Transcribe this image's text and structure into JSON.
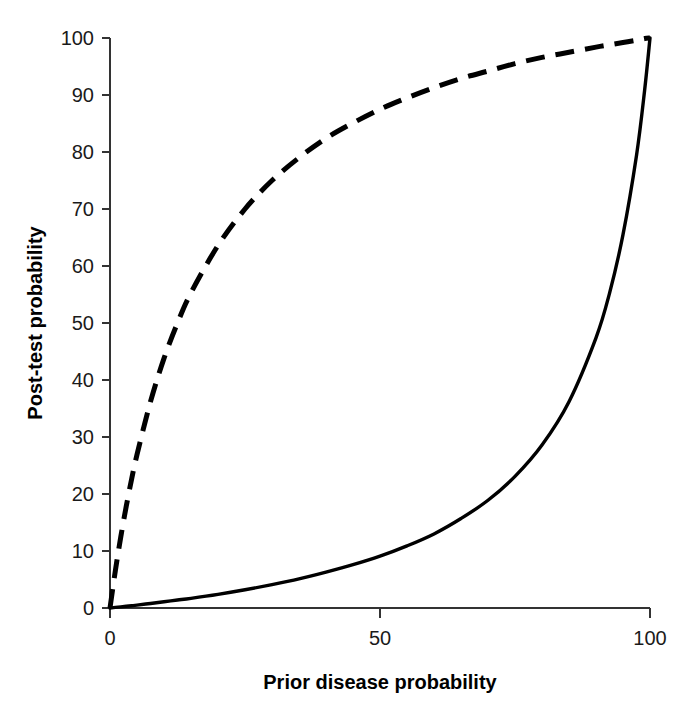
{
  "chart_data": {
    "type": "line",
    "title": "",
    "subtitle": "",
    "xlabel": "Prior disease probability",
    "ylabel": "Post-test probability",
    "xlim": [
      0,
      100
    ],
    "ylim": [
      0,
      100
    ],
    "xticks": [
      0,
      50,
      100
    ],
    "xticklabels": [
      "0",
      "50",
      "100"
    ],
    "yticks": [
      0,
      10,
      20,
      30,
      40,
      50,
      60,
      70,
      80,
      90,
      100
    ],
    "yticklabels": [
      "0",
      "10",
      "20",
      "30",
      "40",
      "50",
      "60",
      "70",
      "80",
      "90",
      "100"
    ],
    "grid": false,
    "legend": null,
    "legend_position": "none",
    "annotations": [],
    "x": [
      0,
      1,
      2,
      3,
      4,
      5,
      7.5,
      10,
      12.5,
      15,
      20,
      25,
      30,
      35,
      40,
      45,
      50,
      55,
      60,
      65,
      70,
      75,
      80,
      85,
      90,
      92.5,
      95,
      97.5,
      99,
      100
    ],
    "series": [
      {
        "name": "Positive test result",
        "style": "dashed",
        "color": "#000000",
        "likelihood_ratio": 7.0,
        "values": [
          0,
          6.6,
          12.5,
          17.8,
          22.6,
          26.9,
          36.2,
          43.8,
          50.0,
          55.3,
          63.6,
          70.0,
          75.0,
          79.0,
          82.4,
          85.1,
          87.5,
          89.5,
          91.3,
          92.9,
          94.2,
          95.5,
          96.6,
          97.5,
          98.4,
          98.8,
          99.2,
          99.6,
          99.9,
          100
        ]
      },
      {
        "name": "Negative test result",
        "style": "solid",
        "color": "#000000",
        "likelihood_ratio": 0.1,
        "values": [
          0,
          0.1,
          0.2,
          0.3,
          0.4,
          0.5,
          0.8,
          1.1,
          1.4,
          1.7,
          2.4,
          3.2,
          4.1,
          5.1,
          6.3,
          7.6,
          9.1,
          10.9,
          13.0,
          15.7,
          18.9,
          23.1,
          28.6,
          36.2,
          47.4,
          55.2,
          65.5,
          79.4,
          90.8,
          100
        ]
      }
    ]
  },
  "axes": {
    "x_title": "Prior disease probability",
    "y_title": "Post-test probability"
  }
}
